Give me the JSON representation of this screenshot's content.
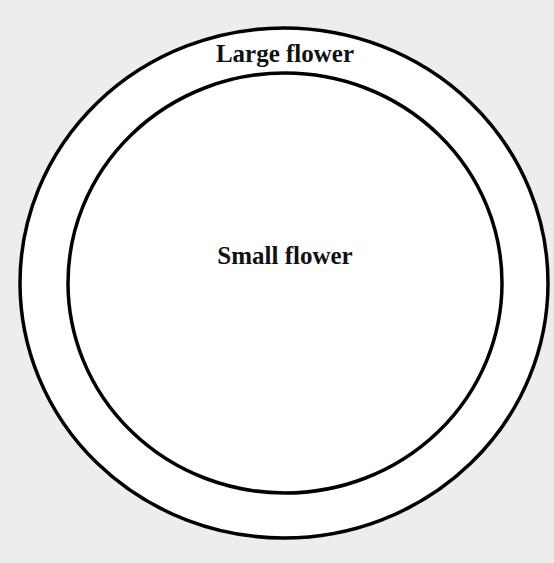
{
  "diagram": {
    "type": "nested-circles",
    "outer": {
      "label": "Large flower"
    },
    "inner": {
      "label": "Small flower"
    }
  }
}
